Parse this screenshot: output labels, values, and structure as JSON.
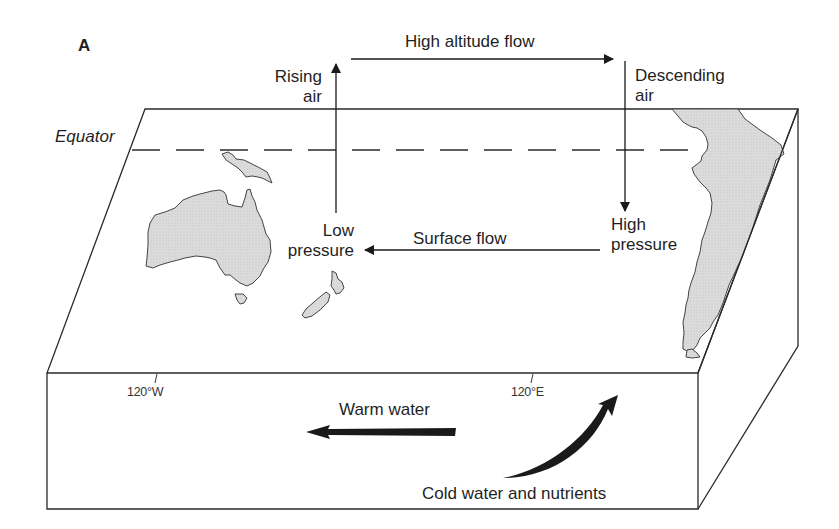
{
  "figure": {
    "panel_label": "A",
    "colors": {
      "line": "#2a2a2a",
      "land_fill": "#d9d9d9",
      "arrow_fill": "#1a1a1a",
      "background": "#ffffff"
    }
  },
  "atmosphere": {
    "high_altitude_flow": "High altitude flow",
    "rising_air": [
      "Rising",
      "air"
    ],
    "descending_air": [
      "Descending",
      "air"
    ],
    "low_pressure": [
      "Low",
      "pressure"
    ],
    "high_pressure": [
      "High",
      "pressure"
    ],
    "surface_flow": "Surface flow"
  },
  "surface": {
    "equator_label": "Equator",
    "landmasses": [
      "Australia",
      "New Guinea",
      "New Zealand",
      "Tasmania",
      "South America"
    ]
  },
  "ocean": {
    "longitude_left": "120°W",
    "longitude_right": "120°E",
    "warm_water": "Warm water",
    "cold_water": "Cold water and nutrients"
  }
}
